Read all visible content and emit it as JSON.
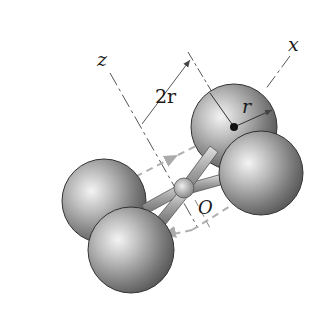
{
  "figure": {
    "labels": {
      "z_axis": "z",
      "x_axis": "x",
      "spacing": "2r",
      "radius": "r",
      "origin": "O"
    },
    "spheres": [
      {
        "name": "top",
        "cx": 234,
        "cy": 127,
        "r": 43
      },
      {
        "name": "left",
        "cx": 104,
        "cy": 201,
        "r": 42
      },
      {
        "name": "right",
        "cx": 261,
        "cy": 173,
        "r": 42
      },
      {
        "name": "bottom",
        "cx": 131,
        "cy": 250,
        "r": 43
      }
    ],
    "colors": {
      "sphere_light": "#f2f2f2",
      "sphere_mid": "#a8a8a8",
      "sphere_dark": "#4a4a4a",
      "axis_line": "#555555",
      "dashed_line": "#b0b0b0"
    }
  }
}
